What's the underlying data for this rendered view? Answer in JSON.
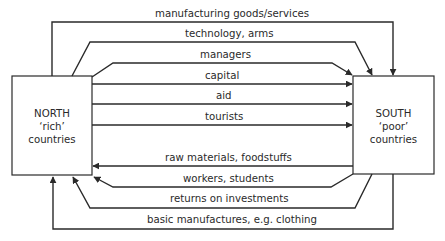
{
  "diagram": {
    "north": {
      "line1": "NORTH",
      "line2": "‘rich’",
      "line3": "countries"
    },
    "south": {
      "line1": "SOUTH",
      "line2": "‘poor’",
      "line3": "countries"
    },
    "flows_north_to_south": [
      {
        "label": "manufacturing goods/services"
      },
      {
        "label": "technology, arms"
      },
      {
        "label": "managers"
      },
      {
        "label": "capital"
      },
      {
        "label": "aid"
      },
      {
        "label": "tourists"
      }
    ],
    "flows_south_to_north": [
      {
        "label": "raw materials, foodstuffs"
      },
      {
        "label": "workers, students"
      },
      {
        "label": "returns on investments"
      },
      {
        "label": "basic manufactures, e.g. clothing"
      }
    ],
    "colors": {
      "stroke": "#2a2a2a",
      "background": "#ffffff"
    }
  }
}
